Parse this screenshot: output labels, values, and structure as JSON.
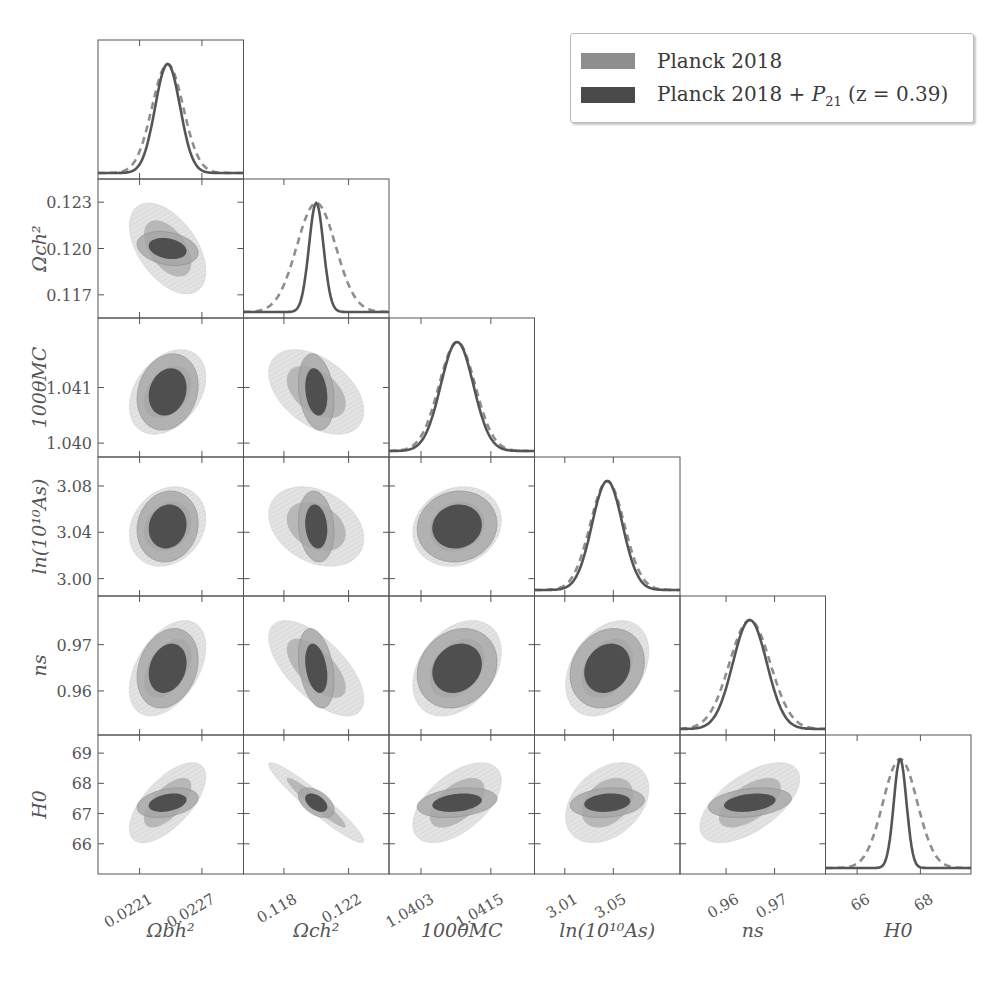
{
  "chart_data": {
    "type": "corner-plot",
    "title": "",
    "parameters": [
      {
        "key": "ombh2",
        "label": "Ωbh²",
        "label_parts": [
          "Ω",
          "b",
          "h",
          "2"
        ],
        "range": [
          0.0217,
          0.0231
        ],
        "ticks": [
          0.0221,
          0.0227
        ],
        "tick_labels": [
          "0.0221",
          "0.0227"
        ],
        "mean": 0.02237
      },
      {
        "key": "omch2",
        "label": "Ωch²",
        "label_parts": [
          "Ω",
          "c",
          "h",
          "2"
        ],
        "range": [
          0.1155,
          0.1245
        ],
        "ticks": [
          0.117,
          0.12,
          0.123
        ],
        "tick_labels": [
          "0.117",
          "0.120",
          "0.123"
        ],
        "x_ticks": [
          0.118,
          0.122
        ],
        "x_tick_labels": [
          "0.118",
          "0.122"
        ],
        "mean": 0.12
      },
      {
        "key": "theta",
        "label": "100θMC",
        "label_parts": [
          "100",
          "θ",
          "MC"
        ],
        "range": [
          1.03975,
          1.04225
        ],
        "ticks": [
          1.04,
          1.041
        ],
        "tick_labels": [
          "1.040",
          "1.041"
        ],
        "x_ticks": [
          1.0403,
          1.0415
        ],
        "x_tick_labels": [
          "1.0403",
          "1.0415"
        ],
        "mean": 1.04092
      },
      {
        "key": "logA",
        "label": "ln(10¹⁰As)",
        "label_parts": [
          "ln(10",
          "10",
          "A",
          "s",
          ")"
        ],
        "range": [
          2.985,
          3.105
        ],
        "ticks": [
          3.0,
          3.04,
          3.08
        ],
        "tick_labels": [
          "3.00",
          "3.04",
          "3.08"
        ],
        "x_ticks": [
          3.01,
          3.05
        ],
        "x_tick_labels": [
          "3.01",
          "3.05"
        ],
        "mean": 3.045
      },
      {
        "key": "ns",
        "label": "ns",
        "label_parts": [
          "n",
          "s"
        ],
        "range": [
          0.9505,
          0.9805
        ],
        "ticks": [
          0.96,
          0.97
        ],
        "tick_labels": [
          "0.96",
          "0.97"
        ],
        "x_ticks": [
          0.96,
          0.97
        ],
        "x_tick_labels": [
          "0.96",
          "0.97"
        ],
        "mean": 0.9649
      },
      {
        "key": "H0",
        "label": "H0",
        "label_parts": [
          "H",
          "0"
        ],
        "range": [
          65.0,
          69.6
        ],
        "ticks": [
          66,
          67,
          68,
          69
        ],
        "tick_labels": [
          "66",
          "67",
          "68",
          "69"
        ],
        "x_ticks": [
          66,
          68
        ],
        "x_tick_labels": [
          "66",
          "68"
        ],
        "mean": 67.36
      }
    ],
    "series": [
      {
        "name": "Planck 2018",
        "color": "#8e8e8e",
        "line_style": "dashed",
        "sigma": {
          "ombh2": 0.00015,
          "omch2": 0.0012,
          "theta": 0.00031,
          "logA": 0.014,
          "ns": 0.0042,
          "H0": 0.54
        }
      },
      {
        "name": "Planck 2018 + P21 (z = 0.39)",
        "color": "#4d4d4d",
        "line_style": "solid",
        "sigma": {
          "ombh2": 0.00012,
          "omch2": 0.00045,
          "theta": 0.00028,
          "logA": 0.0125,
          "ns": 0.0035,
          "H0": 0.2
        }
      }
    ],
    "correlations_planck": {
      "omch2|ombh2": -0.5,
      "theta|ombh2": 0.35,
      "theta|omch2": -0.45,
      "logA|ombh2": 0.2,
      "logA|omch2": -0.3,
      "logA|theta": 0.15,
      "ns|ombh2": 0.45,
      "ns|omch2": -0.65,
      "ns|theta": 0.35,
      "ns|logA": 0.35,
      "H0|ombh2": 0.65,
      "H0|omch2": -0.95,
      "H0|theta": 0.55,
      "H0|logA": 0.35,
      "H0|ns": 0.6
    },
    "contour_levels": [
      "68%",
      "95%"
    ],
    "grid": false,
    "legend_position": "upper right"
  },
  "legend": {
    "entries": [
      {
        "label": "Planck 2018",
        "color": "#8e8e8e"
      },
      {
        "label_prefix": "Planck 2018 + ",
        "label_math": "P",
        "label_sub": "21",
        "label_suffix": " (z = 0.39)",
        "color": "#4a4a4a"
      }
    ]
  },
  "colors": {
    "planck_outer": "#dcdcdc",
    "planck_inner": "#b0b0b0",
    "p21_outer": "#a5a5a5",
    "p21_inner": "#4f4f4f",
    "axis": "#555555",
    "curve_planck": "#8e8e8e",
    "curve_p21": "#555555"
  }
}
